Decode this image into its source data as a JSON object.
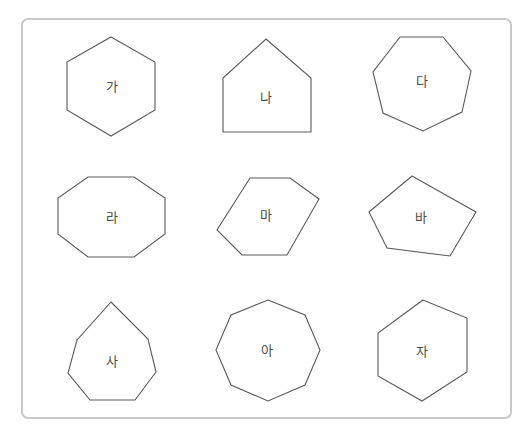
{
  "figure": {
    "colors": {
      "frame_border": "#c9c9c9",
      "shape_stroke": "#5a5a5a",
      "label": "#4a4a4a",
      "background": "#ffffff"
    }
  },
  "shapes": [
    {
      "label": "가",
      "type": "hexagon",
      "sides": 6,
      "points": "111,37 155,62 155,110 111,136 67,110 67,62",
      "label_pos": [
        112,
        87
      ]
    },
    {
      "label": "나",
      "type": "pentagon",
      "sides": 5,
      "points": "266,39 311,78 311,132 223,132 223,78",
      "label_pos": [
        266,
        98
      ]
    },
    {
      "label": "다",
      "type": "heptagon",
      "sides": 7,
      "points": "400,37 443,37 471,71 462,112 423,131 383,113 373,72",
      "label_pos": [
        422,
        82
      ]
    },
    {
      "label": "라",
      "type": "octagon",
      "sides": 8,
      "points": "88,177 134,177 165,198 165,234 134,257 88,257 58,234 58,198",
      "label_pos": [
        112,
        218
      ]
    },
    {
      "label": "마",
      "type": "hexagon",
      "sides": 6,
      "points": "250,178 290,178 319,199 287,255 242,255 217,230",
      "label_pos": [
        266,
        216
      ]
    },
    {
      "label": "바",
      "type": "pentagon",
      "sides": 5,
      "points": "412,176 476,212 450,256 387,248 369,212",
      "label_pos": [
        421,
        218
      ]
    },
    {
      "label": "사",
      "type": "heptagon",
      "sides": 7,
      "points": "111,302 148,339 156,372 135,400 90,400 68,373 77,340",
      "label_pos": [
        112,
        362
      ]
    },
    {
      "label": "아",
      "type": "octagon",
      "sides": 8,
      "points": "268,300 305,315 320,350 305,385 268,401 231,385 216,350 231,315",
      "label_pos": [
        267,
        351
      ]
    },
    {
      "label": "자",
      "type": "hexagon",
      "sides": 6,
      "points": "423,300 467,318 467,372 422,401 378,376 378,333",
      "label_pos": [
        422,
        352
      ]
    }
  ]
}
